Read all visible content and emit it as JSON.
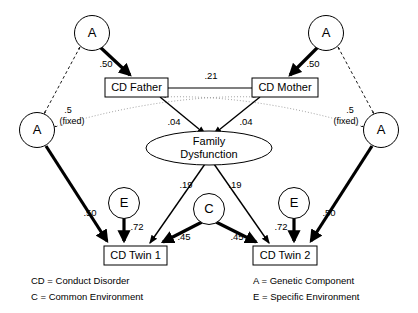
{
  "diagram": {
    "nodes": {
      "a_father": {
        "label": "A",
        "kind": "latent-circle",
        "role": "genetic-father"
      },
      "a_mother": {
        "label": "A",
        "kind": "latent-circle",
        "role": "genetic-mother"
      },
      "a_twin1": {
        "label": "A",
        "kind": "latent-circle",
        "role": "genetic-twin1"
      },
      "a_twin2": {
        "label": "A",
        "kind": "latent-circle",
        "role": "genetic-twin2"
      },
      "e_twin1": {
        "label": "E",
        "kind": "latent-circle",
        "role": "specific-environment-twin1"
      },
      "e_twin2": {
        "label": "E",
        "kind": "latent-circle",
        "role": "specific-environment-twin2"
      },
      "c_common": {
        "label": "C",
        "kind": "latent-circle",
        "role": "common-environment"
      },
      "cd_father": {
        "label": "CD Father",
        "kind": "observed-box"
      },
      "cd_mother": {
        "label": "CD Mother",
        "kind": "observed-box"
      },
      "cd_twin1": {
        "label": "CD Twin 1",
        "kind": "observed-box"
      },
      "cd_twin2": {
        "label": "CD Twin 2",
        "kind": "observed-box"
      },
      "family_dysfunction": {
        "label_line1": "Family",
        "label_line2": "Dysfunction",
        "kind": "latent-ellipse"
      }
    },
    "paths": [
      {
        "id": "a-father-to-cd-father",
        "from": "a_father",
        "to": "cd_father",
        "coefficient": ".50",
        "style": "thick"
      },
      {
        "id": "a-mother-to-cd-mother",
        "from": "a_mother",
        "to": "cd_mother",
        "coefficient": ".50",
        "style": "thick"
      },
      {
        "id": "cd-father-cd-mother-correlation",
        "from": "cd_father",
        "to": "cd_mother",
        "coefficient": ".21",
        "style": "plain"
      },
      {
        "id": "cd-father-to-family-dysfunction",
        "from": "cd_father",
        "to": "family_dysfunction",
        "coefficient": ".04",
        "style": "thin"
      },
      {
        "id": "cd-mother-to-family-dysfunction",
        "from": "cd_mother",
        "to": "family_dysfunction",
        "coefficient": ".04",
        "style": "thin"
      },
      {
        "id": "family-dysfunction-to-cd-twin1",
        "from": "family_dysfunction",
        "to": "cd_twin1",
        "coefficient": ".19",
        "style": "thin"
      },
      {
        "id": "family-dysfunction-to-cd-twin2",
        "from": "family_dysfunction",
        "to": "cd_twin2",
        "coefficient": ".19",
        "style": "thin"
      },
      {
        "id": "c-to-cd-twin1",
        "from": "c_common",
        "to": "cd_twin1",
        "coefficient": ".45",
        "style": "thick"
      },
      {
        "id": "c-to-cd-twin2",
        "from": "c_common",
        "to": "cd_twin2",
        "coefficient": ".45",
        "style": "thick"
      },
      {
        "id": "e-to-cd-twin1",
        "from": "e_twin1",
        "to": "cd_twin1",
        "coefficient": ".72",
        "style": "thick"
      },
      {
        "id": "e-to-cd-twin2",
        "from": "e_twin2",
        "to": "cd_twin2",
        "coefficient": ".72",
        "style": "thick"
      },
      {
        "id": "a-twin1-to-cd-twin1",
        "from": "a_twin1",
        "to": "cd_twin1",
        "coefficient": ".50",
        "style": "thick"
      },
      {
        "id": "a-twin2-to-cd-twin2",
        "from": "a_twin2",
        "to": "cd_twin2",
        "coefficient": ".50",
        "style": "thick"
      },
      {
        "id": "a-father-to-a-twin1-fixed",
        "from": "a_father",
        "to": "a_twin1",
        "coefficient": ".5",
        "qualifier": "(fixed)",
        "style": "dashed"
      },
      {
        "id": "a-mother-to-a-twin2-fixed",
        "from": "a_mother",
        "to": "a_twin2",
        "coefficient": ".5",
        "qualifier": "(fixed)",
        "style": "dashed"
      },
      {
        "id": "a-twin1-to-cd-mother-dotted",
        "from": "a_twin1",
        "to": "cd_mother",
        "coefficient": "",
        "style": "dotted"
      },
      {
        "id": "a-twin2-to-cd-father-dotted",
        "from": "a_twin2",
        "to": "cd_father",
        "coefficient": "",
        "style": "dotted"
      }
    ],
    "labels": {
      "p_50_father": ".50",
      "p_50_mother": ".50",
      "p_21": ".21",
      "p_04_left": ".04",
      "p_04_right": ".04",
      "p_19_left": ".19",
      "p_19_right": ".19",
      "p_45_left": ".45",
      "p_45_right": ".45",
      "p_72_left": ".72",
      "p_72_right": ".72",
      "p_50_twin1": ".50",
      "p_50_twin2": ".50",
      "fixed_left_value": ".5",
      "fixed_left_note": "(fixed)",
      "fixed_right_value": ".5",
      "fixed_right_note": "(fixed)"
    },
    "legend": {
      "left": [
        "CD = Conduct Disorder",
        "C = Common Environment"
      ],
      "right": [
        "A = Genetic Component",
        "E = Specific Environment"
      ]
    }
  }
}
